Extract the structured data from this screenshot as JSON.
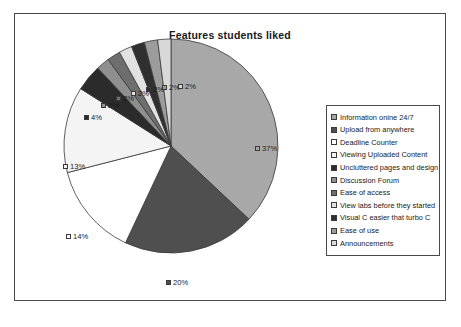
{
  "chart_data": {
    "type": "pie",
    "title": "Features students liked",
    "xlabel": "",
    "ylabel": "",
    "legend_position": "right",
    "grid": false,
    "categories": [
      "Information onine 24/7",
      "Upload from anywhere",
      "Deadline Counter",
      "Viewing Uploaded Content",
      "Uncluttered pages and design",
      "Discussion Forum",
      "Ease of access",
      "View labs before they started",
      "Visual C easier that turbo C",
      "Ease of use",
      "Announcements"
    ],
    "values": [
      37,
      20,
      14,
      13,
      4,
      2,
      2,
      2,
      2,
      2,
      2
    ],
    "data_labels": [
      "37%",
      "20%",
      "14%",
      "13%",
      "4%",
      "2%",
      "2%",
      "2%",
      "2%",
      "2%",
      "2%"
    ],
    "colors": [
      "#a8a8a8",
      "#4f4f4f",
      "#ffffff",
      "#f4f4f4",
      "#2b2b2b",
      "#8f8f8f",
      "#6e6e6e",
      "#e2e2e2",
      "#303030",
      "#9c9c9c",
      "#d8d8d8"
    ]
  },
  "legend": {
    "items": [
      {
        "label": "Information onine 24/7",
        "color": "#a8a8a8"
      },
      {
        "label": "Upload from anywhere",
        "color": "#4f4f4f"
      },
      {
        "label": "Deadline Counter",
        "color": "#ffffff"
      },
      {
        "label": "Viewing Uploaded Content",
        "color": "#f4f4f4"
      },
      {
        "label": "Uncluttered pages and design",
        "color": "#2b2b2b"
      },
      {
        "label": "Discussion Forum",
        "color": "#8f8f8f"
      },
      {
        "label": "Ease of access",
        "color": "#6e6e6e"
      },
      {
        "label": "View labs before they started",
        "color": "#e2e2e2"
      },
      {
        "label": "Visual C easier that turbo C",
        "color": "#303030"
      },
      {
        "label": "Ease of use",
        "color": "#9c9c9c"
      },
      {
        "label": "Announcements",
        "color": "#d8d8d8"
      }
    ]
  },
  "labels": {
    "p37": "37%",
    "p20": "20%",
    "p14": "14%",
    "p13": "13%",
    "p4": "4%",
    "p2a": "2%",
    "p2b": "2%",
    "p2c": "2%",
    "p2d": "2%",
    "p2e": "2%",
    "p2f": "2%"
  }
}
